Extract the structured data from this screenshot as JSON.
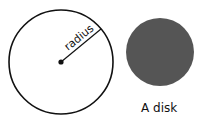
{
  "figure": {
    "circle": {
      "label": "radius",
      "cx": 61,
      "cy": 62,
      "r": 52,
      "stroke": "#111111"
    },
    "disk": {
      "label": "A disk",
      "cx": 160,
      "cy": 52,
      "r": 34,
      "fill": "#555555"
    }
  }
}
